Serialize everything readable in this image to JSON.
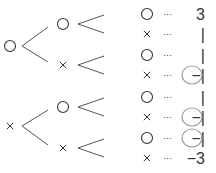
{
  "tree": {
    "roots": [
      {
        "symbol": "○",
        "x": 10,
        "y": 46,
        "children": [
          {
            "symbol": "○",
            "x": 63,
            "y": 24,
            "leaves": [
              {
                "symbol": "○",
                "y": 14,
                "dots": "···",
                "value": "3",
                "circled": false
              },
              {
                "symbol": "×",
                "y": 34,
                "dots": "···",
                "value": "1",
                "circled": false
              }
            ]
          },
          {
            "symbol": "×",
            "x": 63,
            "y": 65,
            "leaves": [
              {
                "symbol": "○",
                "y": 55,
                "dots": "···",
                "value": "1",
                "circled": false
              },
              {
                "symbol": "×",
                "y": 75,
                "dots": "···",
                "value": "−1",
                "circled": true
              }
            ]
          }
        ]
      },
      {
        "symbol": "×",
        "x": 10,
        "y": 126,
        "children": [
          {
            "symbol": "○",
            "x": 63,
            "y": 107,
            "leaves": [
              {
                "symbol": "○",
                "y": 97,
                "dots": "···",
                "value": "1",
                "circled": false
              },
              {
                "symbol": "×",
                "y": 117,
                "dots": "···",
                "value": "−1",
                "circled": true
              }
            ]
          },
          {
            "symbol": "×",
            "x": 63,
            "y": 148,
            "leaves": [
              {
                "symbol": "○",
                "y": 138,
                "dots": "···",
                "value": "−1",
                "circled": true
              },
              {
                "symbol": "×",
                "y": 158,
                "dots": "···",
                "value": "−3",
                "circled": false
              }
            ]
          }
        ]
      }
    ]
  },
  "colors": {
    "line": "#555555",
    "text": "#333333",
    "circle_highlight": "#999999"
  }
}
